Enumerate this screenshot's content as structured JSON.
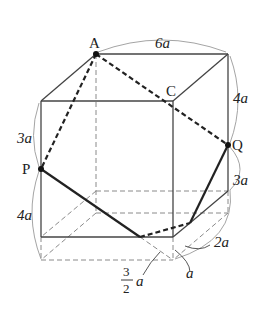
{
  "diagram": {
    "type": "rectangular prism cross-section",
    "colors": {
      "solid": "#444444",
      "bold": "#222222",
      "dashed": "#888888",
      "arc": "#999999",
      "point": "#111111"
    },
    "points": [
      {
        "name": "A",
        "label": "A"
      },
      {
        "name": "C",
        "label": "C"
      },
      {
        "name": "P",
        "label": "P"
      },
      {
        "name": "Q",
        "label": "Q"
      }
    ],
    "dimensions": {
      "top_width": "6a",
      "right_upper": "4a",
      "right_lower": "3a",
      "left_upper": "3a",
      "left_lower": "4a",
      "bottom_right_2a": "2a",
      "bottom_right_a": "a",
      "frac_num": "3",
      "frac_den": "2",
      "frac_var": "a"
    }
  }
}
